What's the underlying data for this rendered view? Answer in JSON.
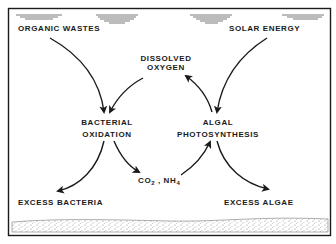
{
  "diagram": {
    "inputs": {
      "left": "ORGANIC  WASTES",
      "right": "SOLAR ENERGY"
    },
    "center_top": {
      "line1": "DISSOLVED",
      "line2": "OXYGEN"
    },
    "process_left": {
      "line1": "BACTERIAL",
      "line2": "OXIDATION"
    },
    "process_right": {
      "line1": "ALGAL",
      "line2": "PHOTOSYNTHESIS"
    },
    "center_bottom": {
      "co2": "CO",
      "co2_sub": "2",
      "separator": " , ",
      "nh4": "NH",
      "nh4_sub": "4"
    },
    "outputs": {
      "left": "EXCESS  BACTERIA",
      "right": "EXCESS  ALGAE"
    },
    "colors": {
      "ink": "#1a1a1a",
      "background": "#ffffff",
      "water_lines": "#555555",
      "sediment": "#8a8a8a"
    }
  }
}
